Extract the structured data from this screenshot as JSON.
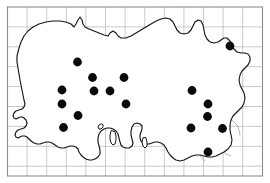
{
  "figure": {
    "kind": "distribution-dot-map",
    "region_title": "Southern England (Wessex) species distribution map",
    "width": 270,
    "height": 183,
    "background_color": "#ffffff"
  },
  "frame": {
    "x": 7.5,
    "y": 7.0,
    "width": 255.0,
    "height": 169.0,
    "stroke_color": "#8a8d95"
  },
  "grid": {
    "visible": true,
    "stroke_color": "#b9bcc4",
    "cell_width": 19.6,
    "cell_height": 19.9,
    "vertical_lines": [
      27.1,
      46.7,
      66.3,
      85.9,
      105.5,
      125.1,
      144.7,
      164.3,
      183.9,
      203.5,
      223.1,
      242.7
    ],
    "horizontal_lines": [
      26.9,
      46.8,
      66.7,
      86.6,
      106.5,
      126.4,
      146.3,
      166.2
    ]
  },
  "legend": {
    "symbol_name": "filled-circle",
    "symbol_color": "#090a0c",
    "symbol_radius": 4.4,
    "record_count": 20
  },
  "chart_data": {
    "type": "scatter",
    "xlabel": "",
    "ylabel": "",
    "grid": true,
    "legend_position": "none",
    "xlim": [
      7.5,
      262.5
    ],
    "ylim": [
      7.0,
      176.0
    ],
    "series": [
      {
        "name": "Records",
        "marker": "filled-circle",
        "color": "#090a0c",
        "points": [
          {
            "x": 230.0,
            "y": 46.0
          },
          {
            "x": 77.5,
            "y": 62.0
          },
          {
            "x": 92.5,
            "y": 77.5
          },
          {
            "x": 124.0,
            "y": 77.5
          },
          {
            "x": 62.0,
            "y": 90.0
          },
          {
            "x": 94.0,
            "y": 91.0
          },
          {
            "x": 110.0,
            "y": 91.0
          },
          {
            "x": 192.0,
            "y": 90.5
          },
          {
            "x": 62.0,
            "y": 104.0
          },
          {
            "x": 126.0,
            "y": 104.0
          },
          {
            "x": 208.0,
            "y": 104.0
          },
          {
            "x": 78.0,
            "y": 115.5
          },
          {
            "x": 207.5,
            "y": 116.5
          },
          {
            "x": 63.5,
            "y": 127.5
          },
          {
            "x": 191.0,
            "y": 128.0
          },
          {
            "x": 222.5,
            "y": 128.5
          },
          {
            "x": 208.0,
            "y": 152.0
          }
        ]
      }
    ]
  }
}
